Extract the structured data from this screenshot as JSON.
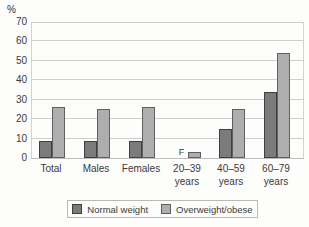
{
  "chart_data": {
    "type": "bar",
    "title": "",
    "unit_label": "%",
    "xlabel": "",
    "ylabel": "%",
    "ylim": [
      0,
      70
    ],
    "yticks": [
      0,
      10,
      20,
      30,
      40,
      50,
      60,
      70
    ],
    "grid": true,
    "legend_position": "bottom",
    "suppressed_label": "F",
    "categories": [
      "Total",
      "Males",
      "Females",
      "20–39\nyears",
      "40–59\nyears",
      "60–79\nyears"
    ],
    "series": [
      {
        "name": "Normal weight",
        "color": "#7b7b7b",
        "border_color": "#3f3f3f",
        "values": [
          9,
          9,
          9,
          null,
          15,
          34
        ]
      },
      {
        "name": "Overweight/obese",
        "color": "#aeaeae",
        "border_color": "#606060",
        "values": [
          26,
          25,
          26,
          3,
          25,
          54
        ]
      }
    ]
  }
}
